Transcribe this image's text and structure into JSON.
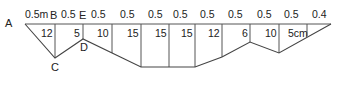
{
  "diagram": {
    "points": {
      "A": "A",
      "B": "B",
      "C": "C",
      "D": "D",
      "E": "E"
    },
    "intervals": [
      "0.5m",
      "0.5",
      "0.5",
      "0.5",
      "0.5",
      "0.5",
      "0.5",
      "0.5",
      "0.5",
      "0.5",
      "0.4"
    ],
    "depths": [
      "12",
      "5",
      "10",
      "15",
      "15",
      "15",
      "12",
      "6",
      "10",
      "5cm"
    ],
    "colors": {
      "line": "#555555",
      "text": "#222222",
      "background": "#ffffff"
    }
  }
}
